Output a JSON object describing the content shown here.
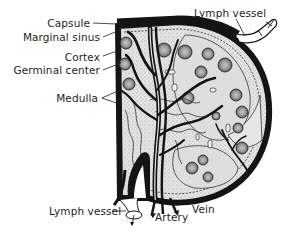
{
  "diagram": {
    "colors": {
      "ink": "#141414",
      "tissue": "#d8d8d8",
      "sinus": "#eeeeee",
      "follicle": "#a8a8a8",
      "background": "#ffffff"
    },
    "labels": {
      "capsule": "Capsule",
      "marginal_sinus": "Marginal sinus",
      "cortex": "Cortex",
      "germinal_center": "Germinal center",
      "medulla": "Medulla",
      "lymph_vessel_afferent": "Lymph vessel",
      "lymph_vessel_efferent": "Lymph vessel",
      "artery": "Artery",
      "vein": "Vein"
    }
  }
}
